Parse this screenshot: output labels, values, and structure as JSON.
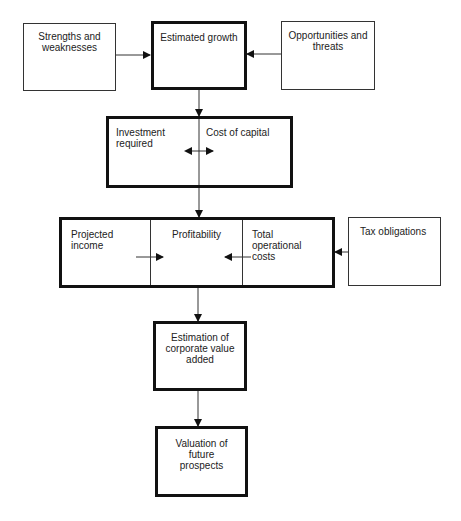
{
  "diagram": {
    "nodes": {
      "strengths": {
        "label": "Strengths and weaknesses"
      },
      "growth": {
        "label": "Estimated growth"
      },
      "opportunities": {
        "label": "Opportunities and threats"
      },
      "investment": {
        "label": "Investment required"
      },
      "cost_capital": {
        "label": "Cost of capital"
      },
      "projected_income": {
        "label": "Projected income"
      },
      "profitability": {
        "label": "Profitability"
      },
      "operational_costs": {
        "label": "Total operational costs"
      },
      "tax": {
        "label": "Tax obligations"
      },
      "value_added": {
        "label": "Estimation of corporate value added"
      },
      "valuation": {
        "label": "Valuation of future prospects"
      }
    },
    "edges": [
      {
        "from": "Strengths and weaknesses",
        "to": "Estimated growth"
      },
      {
        "from": "Opportunities and threats",
        "to": "Estimated growth"
      },
      {
        "from": "Estimated growth",
        "to": "Investment required / Cost of capital"
      },
      {
        "from": "Investment required",
        "to": "Cost of capital",
        "bidirectional": true
      },
      {
        "from": "Investment required / Cost of capital",
        "to": "Profitability"
      },
      {
        "from": "Projected income",
        "to": "Profitability"
      },
      {
        "from": "Total operational costs",
        "to": "Profitability"
      },
      {
        "from": "Tax obligations",
        "to": "Profitability group"
      },
      {
        "from": "Profitability group",
        "to": "Estimation of corporate value added"
      },
      {
        "from": "Estimation of corporate value added",
        "to": "Valuation of future prospects"
      }
    ]
  }
}
